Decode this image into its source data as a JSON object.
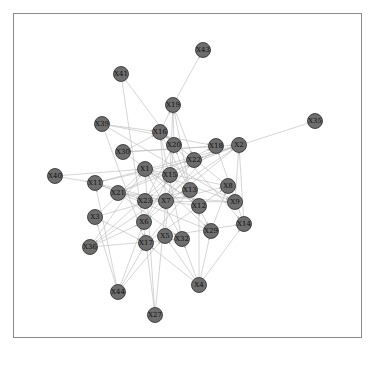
{
  "graph": {
    "type": "directed-network",
    "node_color": "#6e6e6e",
    "edge_color": "#b8b8b8",
    "nodes": [
      {
        "id": "X43",
        "x": 203,
        "y": 50
      },
      {
        "id": "X41",
        "x": 121,
        "y": 74
      },
      {
        "id": "X19",
        "x": 173,
        "y": 105
      },
      {
        "id": "X39",
        "x": 102,
        "y": 124
      },
      {
        "id": "X35",
        "x": 315,
        "y": 121
      },
      {
        "id": "X16",
        "x": 160,
        "y": 132
      },
      {
        "id": "X20",
        "x": 174,
        "y": 145
      },
      {
        "id": "X18",
        "x": 216,
        "y": 146
      },
      {
        "id": "X2",
        "x": 239,
        "y": 145
      },
      {
        "id": "X30",
        "x": 123,
        "y": 152
      },
      {
        "id": "X22",
        "x": 194,
        "y": 160
      },
      {
        "id": "X40",
        "x": 55,
        "y": 176
      },
      {
        "id": "X11",
        "x": 95,
        "y": 183
      },
      {
        "id": "X1",
        "x": 145,
        "y": 169
      },
      {
        "id": "X15",
        "x": 170,
        "y": 175
      },
      {
        "id": "X8",
        "x": 228,
        "y": 186
      },
      {
        "id": "X21",
        "x": 118,
        "y": 193
      },
      {
        "id": "X13",
        "x": 190,
        "y": 190
      },
      {
        "id": "X7",
        "x": 166,
        "y": 201
      },
      {
        "id": "X23",
        "x": 145,
        "y": 201
      },
      {
        "id": "X9",
        "x": 235,
        "y": 202
      },
      {
        "id": "X12",
        "x": 199,
        "y": 206
      },
      {
        "id": "X3",
        "x": 95,
        "y": 217
      },
      {
        "id": "X6",
        "x": 144,
        "y": 222
      },
      {
        "id": "X14",
        "x": 244,
        "y": 224
      },
      {
        "id": "X29",
        "x": 211,
        "y": 231
      },
      {
        "id": "X5",
        "x": 165,
        "y": 236
      },
      {
        "id": "X32",
        "x": 182,
        "y": 239
      },
      {
        "id": "X36",
        "x": 90,
        "y": 247
      },
      {
        "id": "X17",
        "x": 146,
        "y": 243
      },
      {
        "id": "X4",
        "x": 199,
        "y": 285
      },
      {
        "id": "X44",
        "x": 118,
        "y": 292
      },
      {
        "id": "X27",
        "x": 155,
        "y": 315
      }
    ],
    "edges": [
      [
        "X41",
        "X20"
      ],
      [
        "X41",
        "X17"
      ],
      [
        "X19",
        "X43"
      ],
      [
        "X19",
        "X22"
      ],
      [
        "X35",
        "X22"
      ],
      [
        "X39",
        "X18"
      ],
      [
        "X39",
        "X16"
      ],
      [
        "X39",
        "X17"
      ],
      [
        "X16",
        "X19"
      ],
      [
        "X20",
        "X19"
      ],
      [
        "X15",
        "X19"
      ],
      [
        "X13",
        "X19"
      ],
      [
        "X30",
        "X2"
      ],
      [
        "X30",
        "X16"
      ],
      [
        "X40",
        "X1"
      ],
      [
        "X40",
        "X11"
      ],
      [
        "X11",
        "X22"
      ],
      [
        "X11",
        "X23"
      ],
      [
        "X11",
        "X7"
      ],
      [
        "X21",
        "X2"
      ],
      [
        "X21",
        "X18"
      ],
      [
        "X21",
        "X9"
      ],
      [
        "X3",
        "X1"
      ],
      [
        "X3",
        "X13"
      ],
      [
        "X3",
        "X17"
      ],
      [
        "X36",
        "X6"
      ],
      [
        "X36",
        "X1"
      ],
      [
        "X36",
        "X2"
      ],
      [
        "X44",
        "X6"
      ],
      [
        "X44",
        "X17"
      ],
      [
        "X44",
        "X5"
      ],
      [
        "X44",
        "X3"
      ],
      [
        "X44",
        "X11"
      ],
      [
        "X27",
        "X17"
      ],
      [
        "X27",
        "X7"
      ],
      [
        "X27",
        "X1"
      ],
      [
        "X4",
        "X32"
      ],
      [
        "X4",
        "X5"
      ],
      [
        "X4",
        "X12"
      ],
      [
        "X4",
        "X29"
      ],
      [
        "X4",
        "X17"
      ],
      [
        "X4",
        "X14"
      ],
      [
        "X14",
        "X2"
      ],
      [
        "X14",
        "X18"
      ],
      [
        "X9",
        "X2"
      ],
      [
        "X8",
        "X16"
      ],
      [
        "X8",
        "X1"
      ],
      [
        "X29",
        "X11"
      ],
      [
        "X29",
        "X8"
      ],
      [
        "X12",
        "X1"
      ],
      [
        "X12",
        "X21"
      ],
      [
        "X13",
        "X20"
      ],
      [
        "X7",
        "X16"
      ],
      [
        "X7",
        "X8"
      ],
      [
        "X23",
        "X20"
      ],
      [
        "X23",
        "X9"
      ],
      [
        "X6",
        "X15"
      ],
      [
        "X6",
        "X22"
      ],
      [
        "X5",
        "X20"
      ],
      [
        "X5",
        "X14"
      ],
      [
        "X32",
        "X1"
      ],
      [
        "X32",
        "X16"
      ],
      [
        "X17",
        "X13"
      ],
      [
        "X17",
        "X8"
      ],
      [
        "X22",
        "X2"
      ],
      [
        "X22",
        "X23"
      ],
      [
        "X1",
        "X9"
      ],
      [
        "X1",
        "X29"
      ],
      [
        "X15",
        "X12"
      ],
      [
        "X15",
        "X36"
      ],
      [
        "X18",
        "X7"
      ],
      [
        "X18",
        "X30"
      ],
      [
        "X2",
        "X6"
      ],
      [
        "X2",
        "X11"
      ],
      [
        "X20",
        "X14"
      ],
      [
        "X16",
        "X29"
      ],
      [
        "X21",
        "X32"
      ],
      [
        "X30",
        "X12"
      ],
      [
        "X39",
        "X9"
      ],
      [
        "X36",
        "X32"
      ]
    ]
  }
}
